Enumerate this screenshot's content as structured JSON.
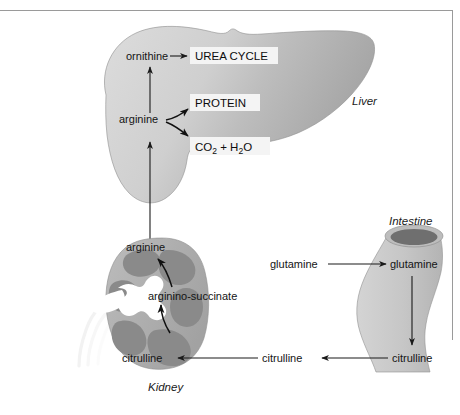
{
  "figure": {
    "colors": {
      "liver_light": "#d6d6d6",
      "liver_dark": "#a8a8a8",
      "kidney_cortex": "#b0b0b0",
      "kidney_medulla": "#8a8a8a",
      "kidney_pelvis": "#ffffff",
      "intestine_body": "#c9c9c9",
      "intestine_lumen": "#6f6f6f",
      "arrow": "#1a1a1a",
      "box_fill": "#f4f4f4",
      "background": "#ffffff",
      "frame": "#9a9a9a"
    }
  },
  "organs": {
    "liver": {
      "label": "Liver"
    },
    "kidney": {
      "label": "Kidney"
    },
    "intestine": {
      "label": "Intestine"
    }
  },
  "liver": {
    "metabolites": {
      "ornithine": "ornithine",
      "arginine": "arginine"
    },
    "boxes": {
      "urea_cycle": "UREA CYCLE",
      "protein": "PROTEIN",
      "co2_h2o_prefix": "CO",
      "co2_sub": "2",
      "co2_plus": " + H",
      "h2o_sub": "2",
      "h2o_suffix": "O"
    }
  },
  "kidney": {
    "metabolites": {
      "arginine": "arginine",
      "arginino_succinate": "arginino-succinate",
      "citrulline": "citrulline"
    }
  },
  "intestine": {
    "metabolites": {
      "glutamine": "glutamine",
      "citrulline": "citrulline"
    }
  },
  "transport": {
    "glutamine_in": "glutamine",
    "citrulline_mid": "citrulline"
  }
}
